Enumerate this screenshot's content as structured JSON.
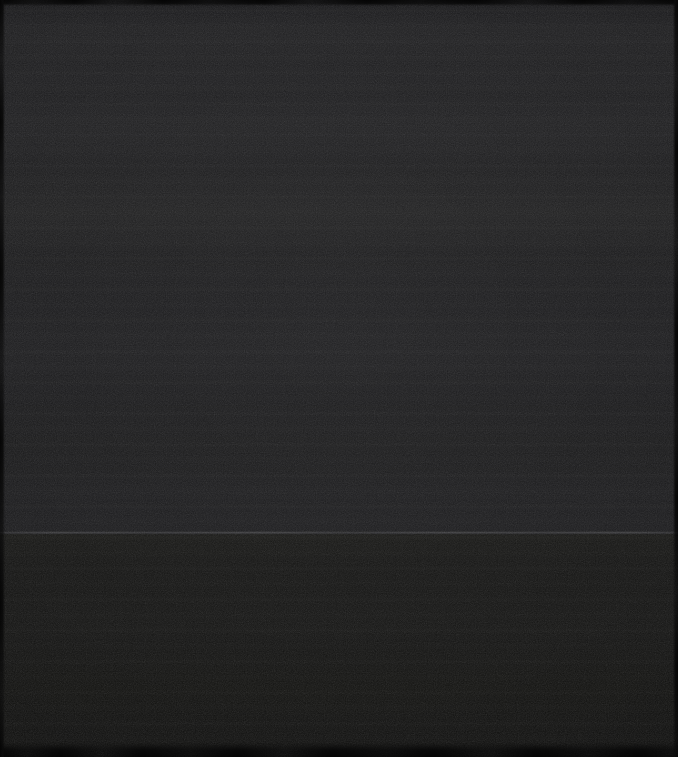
{
  "artwork": {
    "title": "Untitled",
    "medium": "Abstract monochrome colour-field painting on canvas",
    "orientation": "portrait",
    "width_px": 678,
    "height_px": 757,
    "description": "A near-black abstract colour-field painting divided into two horizontal zones by a faint, slightly lighter horizon line roughly three-quarters of the way down. Fine canvas weave and soft horizontal brush scumbling are visible throughout; the photographed canvas edges read as darker irregular margins.",
    "visible_text": "none",
    "signature": "none"
  },
  "composition": {
    "regions": [
      {
        "name": "upper-field",
        "label": "Upper colour field",
        "top_px": 0,
        "height_px": 534,
        "base_color": "#1d1d1f",
        "tone": "dark neutral charcoal, faintly cool",
        "texture": "fine canvas weave with soft horizontal brush banding"
      },
      {
        "name": "lower-field",
        "label": "Lower colour field",
        "top_px": 534,
        "height_px": 223,
        "base_color": "#151514",
        "tone": "deeper near-black, faintly warm",
        "texture": "fine canvas weave, flatter and more uniform"
      }
    ],
    "horizon": {
      "name": "horizon-line",
      "label": "Dividing horizon highlight",
      "y_px": 533,
      "thickness_px": 3,
      "color": "#4e4e50",
      "note": "thin lighter edge running the full width, slightly uneven"
    },
    "edges": [
      {
        "name": "edge-top",
        "label": "Top canvas edge",
        "thickness_px": 5,
        "color": "#070707"
      },
      {
        "name": "edge-bottom",
        "label": "Bottom canvas edge",
        "thickness_px": 12,
        "color": "#060606"
      },
      {
        "name": "edge-left",
        "label": "Left canvas edge",
        "thickness_px": 4,
        "color": "#080808"
      },
      {
        "name": "edge-right",
        "label": "Right canvas edge",
        "thickness_px": 4,
        "color": "#080808"
      }
    ]
  },
  "palette": {
    "upper_field": "#1d1d1f",
    "lower_field": "#151514",
    "horizon_highlight": "#4e4e50",
    "canvas_edge": "#070707",
    "darkest": "#0d0d0d",
    "lightest": "#222224"
  }
}
